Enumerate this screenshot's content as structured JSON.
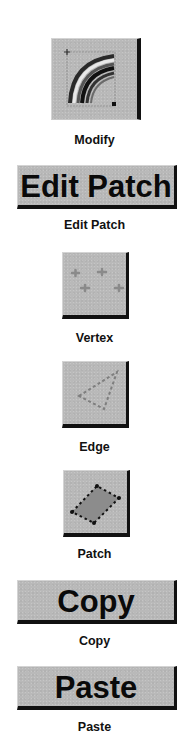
{
  "palette": {
    "background": "#ffffff",
    "button_face": "#b9b9b9",
    "button_shadow": "#111111",
    "button_highlight": "#d4d4d4",
    "text": "#111111"
  },
  "toolbar": {
    "modify": {
      "icon": "curved-patch-icon",
      "label": "Modify"
    },
    "edit_patch": {
      "button_text": "Edit Patch",
      "label": "Edit Patch"
    },
    "vertex": {
      "icon": "vertex-points-icon",
      "label": "Vertex"
    },
    "edge": {
      "icon": "dashed-triangle-edge-icon",
      "label": "Edge"
    },
    "patch": {
      "icon": "filled-quad-patch-icon",
      "label": "Patch"
    },
    "copy": {
      "button_text": "Copy",
      "label": "Copy"
    },
    "paste": {
      "button_text": "Paste",
      "label": "Paste"
    }
  }
}
